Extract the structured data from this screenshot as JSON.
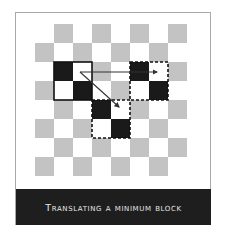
{
  "figure": {
    "caption": "Translating a minimum block",
    "grid": {
      "rows": 8,
      "cols": 8,
      "origin_x": 35,
      "origin_y": 24,
      "cell_size": 19,
      "pattern": "checkerboard",
      "light_color": "#ffffff",
      "gray_color": "#c3c3c3",
      "black_color": "#1a1a1a"
    },
    "blocks": [
      {
        "name": "original-block",
        "col": 1,
        "row": 2,
        "size": 2,
        "border": "solid",
        "black_cells": [
          [
            1,
            2
          ],
          [
            2,
            3
          ]
        ]
      },
      {
        "name": "translated-block-right",
        "col": 5,
        "row": 2,
        "size": 2,
        "border": "dashed",
        "black_cells": [
          [
            5,
            2
          ],
          [
            6,
            3
          ]
        ]
      },
      {
        "name": "translated-block-diagonal",
        "col": 3,
        "row": 4,
        "size": 2,
        "border": "dashed",
        "black_cells": [
          [
            3,
            4
          ],
          [
            4,
            5
          ]
        ]
      }
    ],
    "arrows": [
      {
        "name": "arrow-right",
        "from": [
          80,
          72
        ],
        "to": [
          157,
          72
        ]
      },
      {
        "name": "arrow-diagonal",
        "from": [
          80,
          72
        ],
        "to": [
          119,
          107
        ]
      }
    ]
  }
}
